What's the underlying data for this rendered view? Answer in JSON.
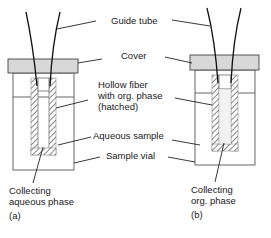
{
  "labels": {
    "guide_tube": "Guide tube",
    "cover": "Cover",
    "hollow_fiber_1": "Hollow fiber",
    "hollow_fiber_2": "with org. phase",
    "hollow_fiber_3": "(hatched)",
    "aqueous_sample": "Aqueous sample",
    "sample_vial": "Sample vial"
  },
  "panel_a": {
    "caption": "(a)",
    "collect_1": "Collecting",
    "collect_2": "aqueous phase"
  },
  "panel_b": {
    "caption": "(b)",
    "collect_1": "Collecting",
    "collect_2": "org. phase"
  },
  "colors": {
    "cover_fill": "#d8d8d8",
    "line": "#222222"
  }
}
